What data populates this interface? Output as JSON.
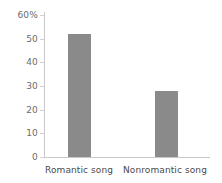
{
  "chart_data": {
    "type": "bar",
    "title": "",
    "subtitle": "",
    "xlabel": "",
    "ylabel": "",
    "categories": [
      "Romantic song",
      "Nonromantic song"
    ],
    "values": [
      52,
      28
    ],
    "series": [
      {
        "name": "",
        "values": [
          52,
          28
        ]
      }
    ],
    "ylim": [
      0,
      60
    ],
    "ytick_values": [
      0,
      10,
      20,
      30,
      40,
      50,
      60
    ],
    "ytick_labels": [
      "0",
      "10",
      "20",
      "30",
      "40",
      "50",
      "60%"
    ],
    "grid": false,
    "legend": false,
    "legend_position": "none",
    "annotations": [],
    "bar_color": "#8a8a8a",
    "axis_color": "#c9c9c9",
    "tick_label_color": "#6b6b6b",
    "category_label_color": "#4a4a4a",
    "background_color": "#ffffff"
  }
}
